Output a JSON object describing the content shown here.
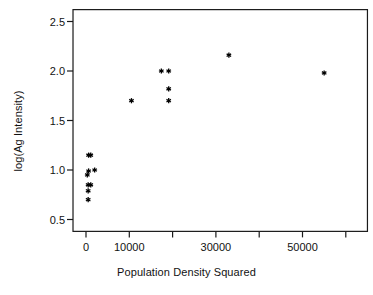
{
  "chart_data": {
    "type": "scatter",
    "title": "",
    "xlabel": "Population Density Squared",
    "ylabel": "log(Ag Intensity)",
    "xlim": [
      -3000,
      65000
    ],
    "ylim": [
      0.38,
      2.62
    ],
    "grid": false,
    "legend": null,
    "marker": "star-asterisk",
    "marker_color": "#000000",
    "x_ticks": [
      0,
      10000,
      20000,
      30000,
      40000,
      50000,
      60000
    ],
    "x_tick_labels": [
      "0",
      "10000",
      "",
      "30000",
      "",
      "50000",
      ""
    ],
    "y_ticks": [
      0.5,
      1.0,
      1.5,
      2.0,
      2.5
    ],
    "y_tick_labels": [
      "0.5",
      "1.0",
      "1.5",
      "2.0",
      "2.5"
    ],
    "points": [
      {
        "x": 600,
        "y": 1.15
      },
      {
        "x": 1100,
        "y": 1.15
      },
      {
        "x": 600,
        "y": 0.99
      },
      {
        "x": 2000,
        "y": 1.0
      },
      {
        "x": 300,
        "y": 0.95
      },
      {
        "x": 500,
        "y": 0.85
      },
      {
        "x": 1100,
        "y": 0.85
      },
      {
        "x": 500,
        "y": 0.79
      },
      {
        "x": 500,
        "y": 0.7
      },
      {
        "x": 10500,
        "y": 1.7
      },
      {
        "x": 17400,
        "y": 2.0
      },
      {
        "x": 19100,
        "y": 2.0
      },
      {
        "x": 19100,
        "y": 1.82
      },
      {
        "x": 19100,
        "y": 1.7
      },
      {
        "x": 33000,
        "y": 2.16
      },
      {
        "x": 55000,
        "y": 1.98
      }
    ]
  },
  "plot": {
    "frame_color": "#1a1a1a"
  }
}
